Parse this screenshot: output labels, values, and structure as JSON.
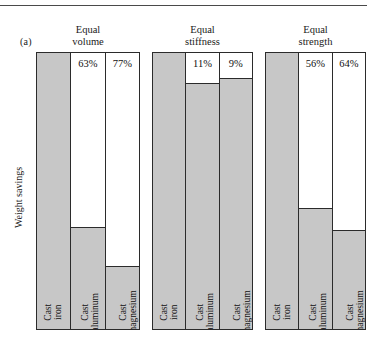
{
  "figure": {
    "panel_letter": "(a)",
    "y_axis_label": "Weight savings"
  },
  "chart_data": {
    "type": "bar",
    "title": "",
    "subtitle": "",
    "xlabel": "",
    "ylabel": "Weight savings",
    "ylim": [
      0,
      100
    ],
    "grid": false,
    "legend": "none",
    "note": "Grouped bar chart. Each group compares Cast iron (reference, 0% savings) with Cast aluminum and Cast magnesium. Gray fill = remaining weight; white space above = weight savings, labeled in percent.",
    "categories": [
      "Cast iron",
      "Cast aluminum",
      "Cast magnesium"
    ],
    "groups": [
      {
        "name": "Equal volume",
        "title_lines": [
          "Equal",
          "volume"
        ],
        "bars": [
          {
            "label": "Cast iron",
            "label_lines": [
              "Cast iron"
            ],
            "savings_pct": null,
            "savings_label": "",
            "fill_pct": 100
          },
          {
            "label": "Cast aluminum",
            "label_lines": [
              "Cast aluminum"
            ],
            "savings_pct": 63,
            "savings_label": "63%",
            "fill_pct": 37
          },
          {
            "label": "Cast magnesium",
            "label_lines": [
              "Cast",
              "magnesium"
            ],
            "savings_pct": 77,
            "savings_label": "77%",
            "fill_pct": 23
          }
        ]
      },
      {
        "name": "Equal stiffness",
        "title_lines": [
          "Equal",
          "stiffness"
        ],
        "bars": [
          {
            "label": "Cast iron",
            "label_lines": [
              "Cast iron"
            ],
            "savings_pct": null,
            "savings_label": "",
            "fill_pct": 100
          },
          {
            "label": "Cast aluminum",
            "label_lines": [
              "Cast aluminum"
            ],
            "savings_pct": 11,
            "savings_label": "11%",
            "fill_pct": 89
          },
          {
            "label": "Cast magnesium",
            "label_lines": [
              "Cast magnesium"
            ],
            "savings_pct": 9,
            "savings_label": "9%",
            "fill_pct": 91
          }
        ]
      },
      {
        "name": "Equal strength",
        "title_lines": [
          "Equal",
          "strength"
        ],
        "bars": [
          {
            "label": "Cast iron",
            "label_lines": [
              "Cast iron"
            ],
            "savings_pct": null,
            "savings_label": "",
            "fill_pct": 100
          },
          {
            "label": "Cast aluminum",
            "label_lines": [
              "Cast aluminum"
            ],
            "savings_pct": 56,
            "savings_label": "56%",
            "fill_pct": 44
          },
          {
            "label": "Cast magnesium",
            "label_lines": [
              "Cast magnesium"
            ],
            "savings_pct": 64,
            "savings_label": "64%",
            "fill_pct": 36
          }
        ]
      }
    ],
    "colors": {
      "bar_fill": "#c7c7c7",
      "bar_outline": "#2b2b2b",
      "background": "#ffffff",
      "text": "#111111",
      "rule": "#4a4a4a"
    }
  }
}
